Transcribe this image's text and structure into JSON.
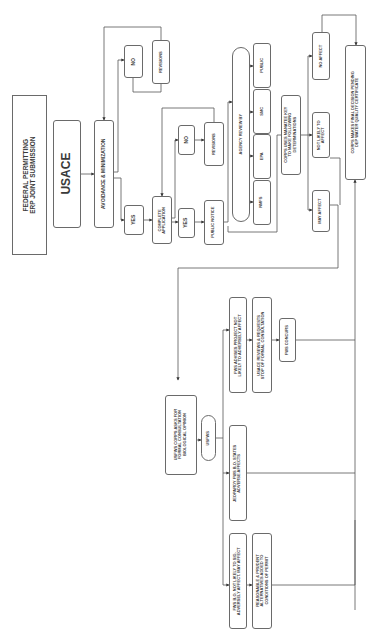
{
  "diagram": {
    "title": "FEDERAL PERMITTING\nERP JOINT SUBMISSION",
    "agency": "USACE",
    "avoidance": "AVOIDANCE & MINIMIZATION",
    "top_branch": {
      "no": "NO",
      "revisions": "REVISIONS"
    },
    "yes_1": "YES",
    "complete_application": "COMPLETE\nAPPLICATION",
    "second_branch": {
      "no": "NO",
      "revisions": "REVISIONS",
      "yes": "YES",
      "public_notice": "PUBLIC NOTICE"
    },
    "agency_review": {
      "label": "AGENCY REVIEW BY",
      "agencies": [
        "NMFS",
        "EPA",
        "SMC",
        "PUBLIC"
      ]
    },
    "manatee_key": "CORPS USES MANATEE KEY\nTO MAKE FOLLOWING\nDETERMINATIONS",
    "determinations": {
      "may_affect": "MAY AFFECT",
      "not_likely": "NOT LIKELY TO\nAFFECT",
      "no_affect": "NO AFFECT"
    },
    "final_decision": "CORPS MAKES FINAL DECISION PENDING\nDEP WATER QUALITY CERTIFICATE",
    "consultation": {
      "request": "USFWS CORPS ASKS FOR\nFORMAL CONSULTATION\nBIOLOGICAL OPINION",
      "usfws": "USFWS",
      "outcomes": {
        "not_likely_adverse": "FWS ADVISES PROJECT NOT\nLIKELY TO ADVERSELY AFFECT",
        "usace_reviews": "USACE REVIEWS & REQUESTS\nSTOP OF FORMAL CONSULTATION",
        "fws_concurs": "FWS CONCURS",
        "jeopardy": "JEOPARDY FWS B.O. STATES\nADVERSE AFFECTS",
        "bo_not_likely": "FWS B.O. NOT LIKELY TO SIG.\nADVERSELY AFFECT. MAY AFFECT",
        "reasonable": "REASONABLE & PRUDENT\nALTERNATIVES ADDED TO\nCONDITIONS OF PERMIT"
      }
    }
  }
}
